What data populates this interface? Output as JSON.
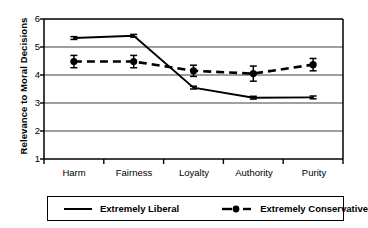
{
  "chart_data": {
    "type": "line",
    "title": "",
    "xlabel": "",
    "ylabel": "Relevance to Moral Decisions",
    "categories": [
      "Harm",
      "Fairness",
      "Loyalty",
      "Authority",
      "Purity"
    ],
    "ylim": [
      1,
      6
    ],
    "yticks": [
      1,
      2,
      3,
      4,
      5,
      6
    ],
    "grid": "horizontal",
    "legend_position": "below-plot",
    "series": [
      {
        "name": "Extremely Liberal",
        "style": "solid",
        "marker": "none",
        "color": "#000000",
        "values": [
          5.32,
          5.4,
          3.55,
          3.19,
          3.2
        ],
        "errors": [
          0.05,
          0.05,
          0.05,
          0.05,
          0.05
        ]
      },
      {
        "name": "Extremely Conservative",
        "style": "dashed",
        "marker": "filled-circle",
        "color": "#000000",
        "values": [
          4.48,
          4.48,
          4.15,
          4.05,
          4.37
        ],
        "errors": [
          0.22,
          0.22,
          0.2,
          0.27,
          0.22
        ]
      }
    ]
  },
  "axes": {
    "ytick_labels": [
      "6",
      "5",
      "4",
      "3",
      "2",
      "1"
    ],
    "xtick_labels": [
      "Harm",
      "Fairness",
      "Loyalty",
      "Authority",
      "Purity"
    ]
  },
  "legend": {
    "items": [
      {
        "label": "Extremely Liberal",
        "marker": "solid-line"
      },
      {
        "label": "Extremely Conservative",
        "marker": "dashed-line-circle"
      }
    ]
  }
}
